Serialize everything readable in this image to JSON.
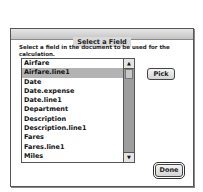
{
  "dialog": {
    "title": "Select a Field",
    "prompt": "Select a field in the document to be used for the calculation.",
    "list": {
      "items": [
        {
          "label": "Airfare",
          "selected": false
        },
        {
          "label": "Airfare.line1",
          "selected": true
        },
        {
          "label": "Date",
          "selected": false
        },
        {
          "label": "Date.expense",
          "selected": false
        },
        {
          "label": "Date.line1",
          "selected": false
        },
        {
          "label": "Department",
          "selected": false
        },
        {
          "label": "Description",
          "selected": false
        },
        {
          "label": "Description.line1",
          "selected": false
        },
        {
          "label": "Fares",
          "selected": false
        },
        {
          "label": "Fares.line1",
          "selected": false
        },
        {
          "label": "Miles",
          "selected": false
        }
      ],
      "scroll_up_icon": "▲",
      "scroll_down_icon": "▼"
    },
    "buttons": {
      "pick": "Pick",
      "done": "Done"
    }
  }
}
